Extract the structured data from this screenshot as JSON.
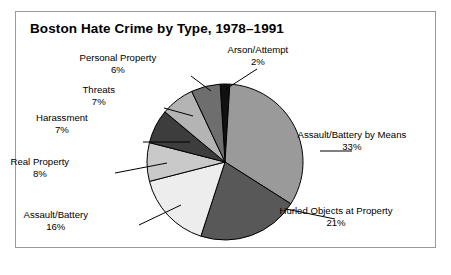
{
  "chart_data": {
    "type": "pie",
    "title": "Boston Hate Crime by Type, 1978–1991",
    "categories": [
      "Assault/Battery by Means",
      "Hurled Objects at Property",
      "Assault/Battery",
      "Real Property",
      "Harassment",
      "Threats",
      "Personal Property",
      "Arson/Attempt"
    ],
    "values": [
      33,
      21,
      16,
      8,
      7,
      7,
      6,
      2
    ],
    "value_labels": [
      "33%",
      "21%",
      "16%",
      "8%",
      "7%",
      "7%",
      "6%",
      "2%"
    ],
    "unit": "%",
    "total": 100,
    "xlabel": "",
    "ylabel": "",
    "legend": "none",
    "grid": false,
    "slice_colors": [
      "#9a9a9a",
      "#585858",
      "#ededed",
      "#c9c9c9",
      "#3d3d3d",
      "#b4b4b4",
      "#6e6e6e",
      "#111111"
    ],
    "slices": [
      {
        "label": "Assault/Battery by Means",
        "value": 33,
        "value_label": "33%",
        "color": "#9a9a9a"
      },
      {
        "label": "Hurled Objects at Property",
        "value": 21,
        "value_label": "21%",
        "color": "#585858"
      },
      {
        "label": "Assault/Battery",
        "value": 16,
        "value_label": "16%",
        "color": "#ededed"
      },
      {
        "label": "Real Property",
        "value": 8,
        "value_label": "8%",
        "color": "#c9c9c9"
      },
      {
        "label": "Harassment",
        "value": 7,
        "value_label": "7%",
        "color": "#3d3d3d"
      },
      {
        "label": "Threats",
        "value": 7,
        "value_label": "7%",
        "color": "#b4b4b4"
      },
      {
        "label": "Personal Property",
        "value": 6,
        "value_label": "6%",
        "color": "#6e6e6e"
      },
      {
        "label": "Arson/Attempt",
        "value": 2,
        "value_label": "2%",
        "color": "#111111"
      }
    ]
  },
  "frame": {
    "border_color": "#9a9a9a",
    "background": "#ffffff"
  }
}
